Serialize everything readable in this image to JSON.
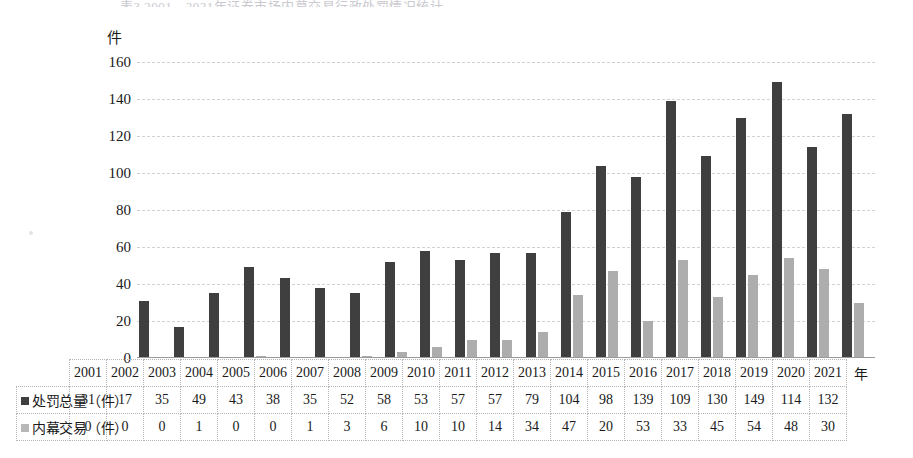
{
  "figure": {
    "top_caption_faint": "表3 2001—2021年证券市场内幕交易行政处罚情况统计",
    "axis_unit_label": "件",
    "x_axis_label": "年"
  },
  "chart_data": {
    "type": "bar",
    "title": "",
    "xlabel": "年",
    "ylabel": "件",
    "ylim": [
      0,
      160
    ],
    "ytick_values": [
      "160",
      "140",
      "120",
      "100",
      "80",
      "60",
      "40",
      "20",
      "0"
    ],
    "grid": true,
    "legend_position": "row-labels-in-table",
    "categories": [
      "2001",
      "2002",
      "2003",
      "2004",
      "2005",
      "2006",
      "2007",
      "2008",
      "2009",
      "2010",
      "2011",
      "2012",
      "2013",
      "2014",
      "2015",
      "2016",
      "2017",
      "2018",
      "2019",
      "2020",
      "2021"
    ],
    "series": [
      {
        "name": "处罚总量（件）",
        "color": "#3f3f3f",
        "values": [
          31,
          17,
          35,
          49,
          43,
          38,
          35,
          52,
          58,
          53,
          57,
          57,
          79,
          104,
          98,
          139,
          109,
          130,
          149,
          114,
          132
        ]
      },
      {
        "name": "内幕交易（件）",
        "color": "#adadad",
        "values": [
          0,
          0,
          0,
          1,
          0,
          0,
          1,
          3,
          6,
          10,
          10,
          14,
          34,
          47,
          20,
          53,
          33,
          45,
          54,
          48,
          30
        ]
      }
    ]
  },
  "table": {
    "header_row_label": "",
    "year_axis_suffix": "年",
    "rows": [
      {
        "label": "处罚总量（件）",
        "swatch": "dark-square-marker",
        "values": [
          "31",
          "17",
          "35",
          "49",
          "43",
          "38",
          "35",
          "52",
          "58",
          "53",
          "57",
          "57",
          "79",
          "104",
          "98",
          "139",
          "109",
          "130",
          "149",
          "114",
          "132"
        ]
      },
      {
        "label": "内幕交易（件）",
        "swatch": "light-square-marker",
        "values": [
          "0",
          "0",
          "0",
          "1",
          "0",
          "0",
          "1",
          "3",
          "6",
          "10",
          "10",
          "14",
          "34",
          "47",
          "20",
          "53",
          "33",
          "45",
          "54",
          "48",
          "30"
        ]
      }
    ]
  }
}
